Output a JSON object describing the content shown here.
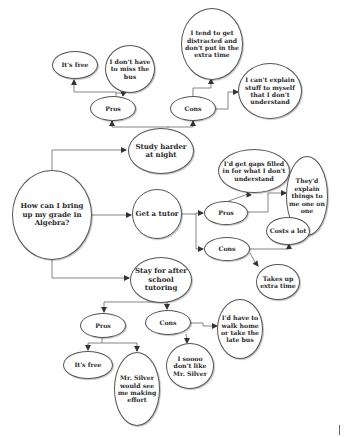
{
  "diagram": {
    "colors": {
      "line": "#555555",
      "node_border": "#555555",
      "text": "#2a2a2a",
      "background": "#ffffff"
    },
    "nodes": {
      "root": {
        "label": "How can I bring up my grade in Algebra?"
      },
      "study": {
        "label": "Study harder at night"
      },
      "study_pros": {
        "label": "Pros"
      },
      "study_pros_free": {
        "label": "It's free"
      },
      "study_pros_bus": {
        "label": "I don't have to miss the bus"
      },
      "study_cons": {
        "label": "Cons"
      },
      "study_cons_distracted": {
        "label": "I tend to get distracted and don't put in the extra time"
      },
      "study_cons_explain": {
        "label": "I can't explain stuff to myself that I don't understand"
      },
      "tutor": {
        "label": "Get a tutor"
      },
      "tutor_pros": {
        "label": "Pros"
      },
      "tutor_pros_gaps": {
        "label": "I'd get gaps filled in for what I don't understand"
      },
      "tutor_pros_oneonone": {
        "label": "They'd explain things to me one on one"
      },
      "tutor_cons": {
        "label": "Cons"
      },
      "tutor_cons_costs": {
        "label": "Costs a lot"
      },
      "tutor_cons_time": {
        "label": "Takes up extra time"
      },
      "stay": {
        "label": "Stay for after school tutoring"
      },
      "stay_pros": {
        "label": "Pros"
      },
      "stay_pros_free": {
        "label": "It's free"
      },
      "stay_pros_silver": {
        "label": "Mr. Silver would see me making effort"
      },
      "stay_cons": {
        "label": "Cons"
      },
      "stay_cons_walk": {
        "label": "I'd have to walk home or take the late bus"
      },
      "stay_cons_dislike": {
        "label": "I soooo don't like Mr. Silver"
      }
    },
    "edges": [
      [
        "root",
        "study"
      ],
      [
        "root",
        "tutor"
      ],
      [
        "root",
        "stay"
      ],
      [
        "study",
        "study_pros"
      ],
      [
        "study",
        "study_cons"
      ],
      [
        "study_pros",
        "study_pros_free"
      ],
      [
        "study_pros",
        "study_pros_bus"
      ],
      [
        "study_cons",
        "study_cons_distracted"
      ],
      [
        "study_cons",
        "study_cons_explain"
      ],
      [
        "tutor",
        "tutor_pros"
      ],
      [
        "tutor",
        "tutor_cons"
      ],
      [
        "tutor_pros",
        "tutor_pros_gaps"
      ],
      [
        "tutor_pros",
        "tutor_pros_oneonone"
      ],
      [
        "tutor_cons",
        "tutor_cons_costs"
      ],
      [
        "tutor_cons",
        "tutor_cons_time"
      ],
      [
        "stay",
        "stay_pros"
      ],
      [
        "stay",
        "stay_cons"
      ],
      [
        "stay_pros",
        "stay_pros_free"
      ],
      [
        "stay_pros",
        "stay_pros_silver"
      ],
      [
        "stay_cons",
        "stay_cons_walk"
      ],
      [
        "stay_cons",
        "stay_cons_dislike"
      ]
    ]
  }
}
